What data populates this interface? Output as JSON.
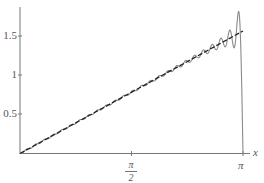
{
  "chart_data": {
    "type": "line",
    "title": "",
    "xlabel": "x",
    "ylabel": "",
    "xlim": [
      0,
      3.14159
    ],
    "ylim": [
      0,
      1.9
    ],
    "x_ticks": [
      {
        "value": 1.5708,
        "label_num": "π",
        "label_den": "2"
      },
      {
        "value": 3.14159,
        "label": "π"
      }
    ],
    "y_ticks": [
      {
        "value": 0.5,
        "label": "0.5"
      },
      {
        "value": 1,
        "label": "1"
      },
      {
        "value": 1.5,
        "label": "1.5"
      }
    ],
    "series": [
      {
        "name": "f(x) = x/2",
        "style": "dashed",
        "color": "#222222",
        "x": [
          0,
          3.14159
        ],
        "y": [
          0,
          1.5708
        ]
      },
      {
        "name": "Fourier partial sum",
        "style": "solid",
        "color": "#888888",
        "terms": 50,
        "peak_near_pi": 1.83,
        "value_at_pi": 0
      }
    ],
    "grid": false,
    "legend": "none"
  },
  "axes": {
    "x_var": "x",
    "x_tick_pi": "π",
    "x_tick_pi_half_num": "π",
    "x_tick_pi_half_den": "2",
    "y_tick_1_5": "1.5",
    "y_tick_1": "1",
    "y_tick_0_5": "0.5"
  },
  "colors": {
    "axis": "#777777",
    "partial_sum": "#8a8a8a",
    "target": "#222222"
  }
}
